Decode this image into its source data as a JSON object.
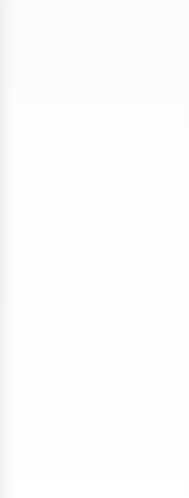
{
  "document": {
    "kind": "scanned-knitting-pattern-excerpt",
    "background_color": "#fefefe",
    "text_color": "#3d3d3b",
    "lines": [
      {
        "id": "finishing-markers",
        "text": "markers.",
        "top": 36,
        "left": -4,
        "style": "body",
        "clipped": true,
        "smudge": "soft"
      },
      {
        "id": "finishing-seams",
        "text": "Sew side and Sleeve seams.",
        "top": 77,
        "left": -4,
        "style": "body",
        "clipped": true,
        "smudge": "soft"
      },
      {
        "id": "finishing-weave",
        "text": "Weave in ends.",
        "top": 118,
        "left": -4,
        "style": "body",
        "clipped": true,
        "smudge": "hard"
      },
      {
        "id": "abbreviations-head",
        "text": "Abbreviations:",
        "top": 157,
        "left": -3,
        "style": "heading",
        "clipped": true,
        "smudge": "hard"
      },
      {
        "id": "abbr-beg",
        "text": "beg = begin(ning)(s)",
        "top": 197,
        "left": -3,
        "style": "body",
        "clipped": true,
        "smudge": "hard"
      },
      {
        "id": "abbr-k",
        "text": "k = knit",
        "top": 239,
        "left": -3,
        "style": "body",
        "clipped": true,
        "smudge": "hard"
      },
      {
        "id": "abbr-p",
        "text": "p = purl",
        "top": 281,
        "left": -3,
        "style": "body",
        "clipped": true,
        "smudge": "hard"
      },
      {
        "id": "abbr-rem",
        "text": "rem = remain(ing)(s)",
        "top": 322,
        "left": -2,
        "style": "body",
        "clipped": true,
        "smudge": "soft"
      },
      {
        "id": "abbr-rep",
        "text": "rep = repeat",
        "top": 363,
        "left": -2,
        "style": "body",
        "clipped": true,
        "smudge": "soft"
      },
      {
        "id": "abbr-rs",
        "text": "RS = right side",
        "top": 404,
        "left": 2,
        "style": "body",
        "clipped": false,
        "smudge": "none"
      },
      {
        "id": "abbr-sts",
        "text": "st(s) = stitch(es)",
        "top": 444,
        "left": 1,
        "style": "body",
        "clipped": false,
        "smudge": "none"
      },
      {
        "id": "abbr-stst",
        "text": "St st = Stockinette stitch",
        "top": 479,
        "left": 3,
        "style": "body",
        "clipped": false,
        "smudge": "none"
      }
    ]
  }
}
